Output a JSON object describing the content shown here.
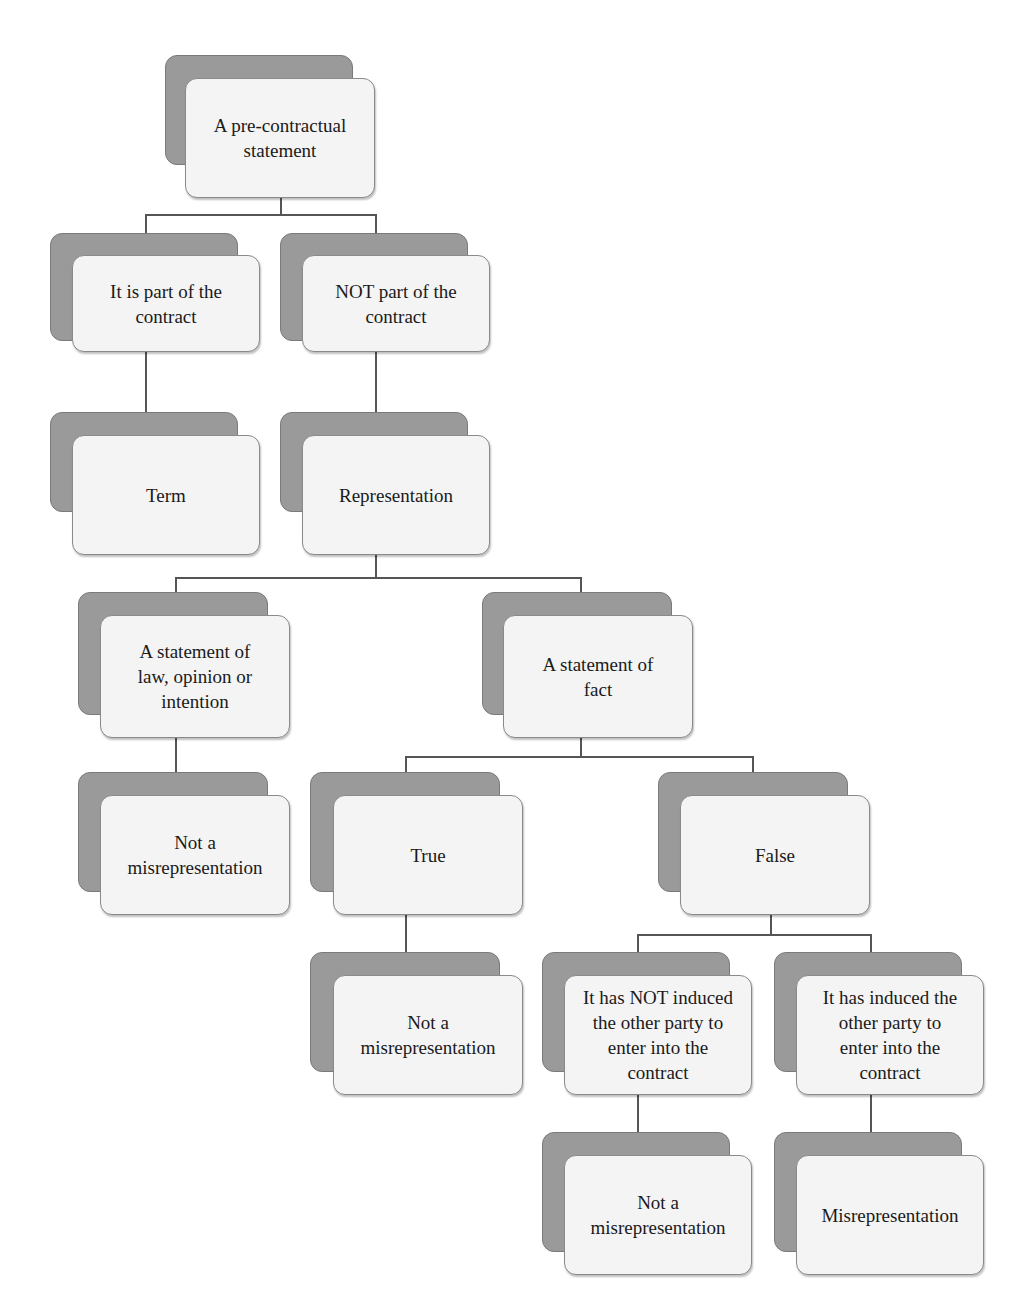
{
  "diagram": {
    "type": "decision-tree",
    "nodes": [
      {
        "id": "root",
        "label": "A pre-contractual\nstatement"
      },
      {
        "id": "part-of-contract",
        "label": "It is part of the\ncontract"
      },
      {
        "id": "not-part-of-contract",
        "label": "NOT part of the\ncontract"
      },
      {
        "id": "term",
        "label": "Term"
      },
      {
        "id": "representation",
        "label": "Representation"
      },
      {
        "id": "statement-law-opinion",
        "label": "A statement of\nlaw, opinion or\nintention"
      },
      {
        "id": "statement-fact",
        "label": "A statement of\nfact"
      },
      {
        "id": "not-misrep-1",
        "label": "Not a\nmisrepresentation"
      },
      {
        "id": "true",
        "label": "True"
      },
      {
        "id": "false",
        "label": "False"
      },
      {
        "id": "not-misrep-2",
        "label": "Not a\nmisrepresentation"
      },
      {
        "id": "not-induced",
        "label": "It has NOT induced\nthe other party to\nenter into the\ncontract"
      },
      {
        "id": "induced",
        "label": "It has induced the\nother party to\nenter into the\ncontract"
      },
      {
        "id": "not-misrep-3",
        "label": "Not a\nmisrepresentation"
      },
      {
        "id": "misrepresentation",
        "label": "Misrepresentation"
      }
    ],
    "edges": [
      [
        "root",
        "part-of-contract"
      ],
      [
        "root",
        "not-part-of-contract"
      ],
      [
        "part-of-contract",
        "term"
      ],
      [
        "not-part-of-contract",
        "representation"
      ],
      [
        "representation",
        "statement-law-opinion"
      ],
      [
        "representation",
        "statement-fact"
      ],
      [
        "statement-law-opinion",
        "not-misrep-1"
      ],
      [
        "statement-fact",
        "true"
      ],
      [
        "statement-fact",
        "false"
      ],
      [
        "true",
        "not-misrep-2"
      ],
      [
        "false",
        "not-induced"
      ],
      [
        "false",
        "induced"
      ],
      [
        "not-induced",
        "not-misrep-3"
      ],
      [
        "induced",
        "misrepresentation"
      ]
    ]
  },
  "colors": {
    "box_back": "#9a9a9a",
    "box_front": "#f4f4f4",
    "connector": "#555555",
    "text": "#1a1a1a"
  }
}
